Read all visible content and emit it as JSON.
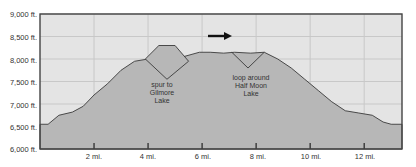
{
  "chart_data": {
    "type": "area",
    "title": "",
    "xlabel": "",
    "ylabel": "",
    "xlim": [
      0,
      13.4
    ],
    "ylim": [
      6000,
      9000
    ],
    "grid": true,
    "x_ticks": [
      2,
      4,
      6,
      8,
      10,
      12
    ],
    "x_tick_labels": [
      "2 mi.",
      "4 mi.",
      "6 mi.",
      "8 mi.",
      "10 mi.",
      "12 mi."
    ],
    "y_ticks": [
      6000,
      6500,
      7000,
      7500,
      8000,
      8500,
      9000
    ],
    "y_tick_labels": [
      "6,000 ft.",
      "6,500 ft.",
      "7,000 ft.",
      "7,500 ft.",
      "8,000 ft.",
      "8,500 ft.",
      "9,000 ft."
    ],
    "series": [
      {
        "name": "Elevation profile",
        "x": [
          0,
          0.3,
          0.7,
          1.2,
          1.6,
          2.0,
          2.5,
          3.0,
          3.5,
          4.0,
          4.7,
          5.3,
          5.9,
          6.3,
          6.8,
          7.2,
          7.8,
          8.3,
          8.8,
          9.3,
          9.8,
          10.3,
          10.8,
          11.3,
          11.8,
          12.3,
          12.7,
          13.0,
          13.4
        ],
        "values": [
          6550,
          6550,
          6750,
          6820,
          6950,
          7200,
          7450,
          7750,
          7950,
          8000,
          7950,
          8050,
          8150,
          8150,
          8130,
          8150,
          8130,
          8150,
          8000,
          7800,
          7550,
          7300,
          7050,
          6850,
          6800,
          6750,
          6600,
          6550,
          6550
        ]
      },
      {
        "name": "Spur to Gilmore Lake",
        "x": [
          3.9,
          4.4,
          5.0,
          5.5,
          4.7,
          3.9
        ],
        "values": [
          8000,
          8300,
          8300,
          7950,
          7550,
          8000
        ]
      },
      {
        "name": "Loop around Half Moon Lake",
        "x": [
          7.1,
          7.7,
          8.3
        ],
        "values": [
          8150,
          7800,
          8150
        ]
      }
    ],
    "annotations": [
      {
        "text": "spur to Gilmore Lake",
        "x": 4.7,
        "y": 7400
      },
      {
        "text": "loop around Half Moon Lake",
        "x": 7.7,
        "y": 7600
      },
      {
        "text": "direction arrow (right)",
        "x": 6.2,
        "y": 8650
      }
    ],
    "colors": {
      "fill": "#b7b7b7",
      "background": "#e4e4e4",
      "grid": "#c8c8c8",
      "line": "#3a3a3a",
      "frame": "#444444"
    }
  },
  "labels": {
    "y": [
      "9,000 ft.",
      "8,500 ft.",
      "8,000 ft.",
      "7,500 ft.",
      "7,000 ft.",
      "6,500 ft.",
      "6,000 ft."
    ],
    "x": [
      "2 mi.",
      "4 mi.",
      "6 mi.",
      "8 mi.",
      "10 mi.",
      "12 mi."
    ],
    "ann_spur": [
      "spur to",
      "Gilmore",
      "Lake"
    ],
    "ann_loop": [
      "loop around",
      "Half Moon",
      "Lake"
    ]
  }
}
